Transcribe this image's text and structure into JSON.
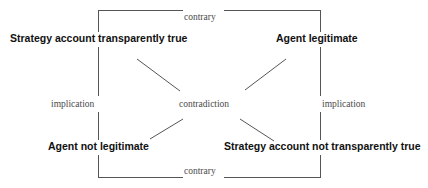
{
  "diagram": {
    "type": "square-of-opposition",
    "line_color": "#555555",
    "text_color": "#111111",
    "relation_text_color": "#4a4a4a",
    "background": "#ffffff",
    "nodes": {
      "top_left": "Strategy account transparently true",
      "top_right": "Agent legitimate",
      "bottom_left": "Agent not legitimate",
      "bottom_right": "Strategy account not transparently true"
    },
    "relations": {
      "top": "contrary",
      "bottom": "contrary",
      "left": "implication",
      "right": "implication",
      "center": "contradiction"
    },
    "edges": [
      {
        "name": "top-contrary-edge",
        "from": "top_left",
        "to": "top_right",
        "label": "contrary"
      },
      {
        "name": "bottom-contrary-edge",
        "from": "bottom_left",
        "to": "bottom_right",
        "label": "contrary"
      },
      {
        "name": "left-implication-edge",
        "from": "top_left",
        "to": "bottom_left",
        "label": "implication"
      },
      {
        "name": "right-implication-edge",
        "from": "top_right",
        "to": "bottom_right",
        "label": "implication"
      },
      {
        "name": "diagonal-tl-br-edge",
        "from": "top_left",
        "to": "bottom_right",
        "label": "contradiction"
      },
      {
        "name": "diagonal-tr-bl-edge",
        "from": "top_right",
        "to": "bottom_left",
        "label": "contradiction"
      }
    ]
  }
}
